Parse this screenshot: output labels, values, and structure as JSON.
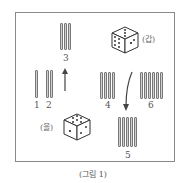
{
  "figure": {
    "caption": "(그림 1)",
    "bundles": [
      {
        "label": "1",
        "sticks": 1
      },
      {
        "label": "2",
        "sticks": 2
      },
      {
        "label": "3",
        "sticks": 3
      },
      {
        "label": "4",
        "sticks": 4
      },
      {
        "label": "5",
        "sticks": 5
      },
      {
        "label": "6",
        "sticks": 6
      }
    ],
    "dice": [
      {
        "label": "(갑)"
      },
      {
        "label": "(을)"
      }
    ],
    "arrows": [
      {
        "from": "1,2",
        "to": "3",
        "direction": "up"
      },
      {
        "from": "4,6",
        "to": "5",
        "direction": "down-curved"
      }
    ]
  }
}
